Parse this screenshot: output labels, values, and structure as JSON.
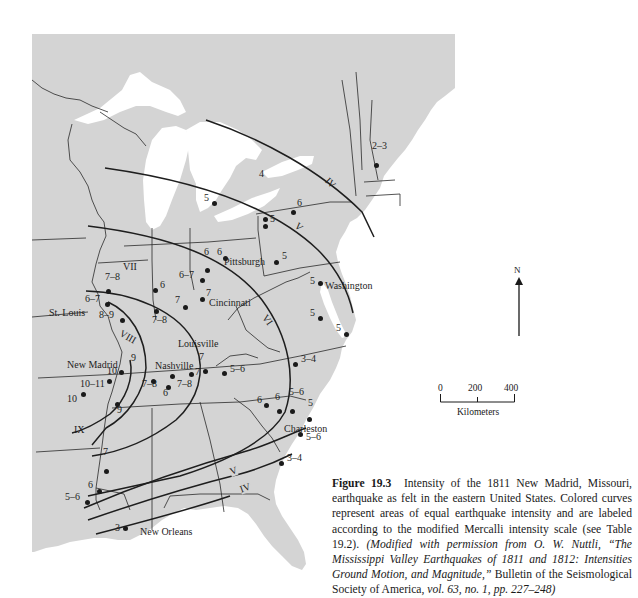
{
  "figure": {
    "number_label": "Figure 19.3",
    "caption_plain": "Intensity of the 1811 New Madrid, Missouri, earthquake as felt in the eastern United States. Colored curves represent areas of equal earthquake intensity and are labeled according to the modified Mercalli intensity scale (see Table 19.2).",
    "caption_italic_1": "(Modified with permission from O. W. Nuttli, “The Mississippi Valley Earthquakes of 1811 and 1812: Intensities Ground Motion, and Magnitude,”",
    "caption_plain_2": "Bulletin of the Seismological Society of America,",
    "caption_italic_2": "vol. 63, no. 1, pp. 227–248)"
  },
  "map": {
    "land_color": "#d4d4d4",
    "water_color": "#ffffff",
    "line_color": "#2a2a2a",
    "cities": [
      {
        "name": "St. Louis",
        "x": 49,
        "y": 308
      },
      {
        "name": "New Madrid",
        "x": 67,
        "y": 360
      },
      {
        "name": "Nashville",
        "x": 155,
        "y": 361
      },
      {
        "name": "Louisville",
        "x": 178,
        "y": 339
      },
      {
        "name": "Cincinnati",
        "x": 209,
        "y": 298
      },
      {
        "name": "Pittsburgh",
        "x": 224,
        "y": 257
      },
      {
        "name": "Washington",
        "x": 325,
        "y": 281
      },
      {
        "name": "Charleston",
        "x": 284,
        "y": 424
      },
      {
        "name": "New Orleans",
        "x": 140,
        "y": 527
      }
    ],
    "isoseismal_labels": [
      {
        "label": "IV",
        "x": 325,
        "y": 178
      },
      {
        "label": "V",
        "x": 295,
        "y": 222
      },
      {
        "label": "VI",
        "x": 262,
        "y": 315
      },
      {
        "label": "VII",
        "x": 123,
        "y": 262
      },
      {
        "label": "VIII",
        "x": 119,
        "y": 332
      },
      {
        "label": "IX",
        "x": 74,
        "y": 425
      },
      {
        "label": "V",
        "x": 230,
        "y": 466
      },
      {
        "label": "IV",
        "x": 240,
        "y": 483
      }
    ],
    "intensity_points": [
      {
        "value": "2–3",
        "x": 376,
        "y": 165,
        "lx": 372,
        "ly": 146
      },
      {
        "value": "4",
        "x": null,
        "y": null,
        "lx": 259,
        "ly": 174
      },
      {
        "value": "6",
        "x": 293,
        "y": 212,
        "lx": 297,
        "ly": 203
      },
      {
        "value": "5",
        "x": 214,
        "y": 203,
        "lx": 204,
        "ly": 198
      },
      {
        "value": "5",
        "x": 265,
        "y": 219,
        "lx": null,
        "ly": null
      },
      {
        "value": "5",
        "x": 265,
        "y": 226,
        "lx": 270,
        "ly": 219
      },
      {
        "value": "5",
        "x": 276,
        "y": 262,
        "lx": 282,
        "ly": 256
      },
      {
        "value": "6",
        "x": 225,
        "y": 258,
        "lx": 217,
        "ly": 252
      },
      {
        "value": "6",
        "x": 207,
        "y": 270,
        "lx": 204,
        "ly": 252
      },
      {
        "value": "6–7",
        "x": 202,
        "y": 280,
        "lx": 179,
        "ly": 275
      },
      {
        "value": "7",
        "x": 202,
        "y": 299,
        "lx": 206,
        "ly": 293
      },
      {
        "value": "7",
        "x": 185,
        "y": 307,
        "lx": 175,
        "ly": 300
      },
      {
        "value": "6",
        "x": 155,
        "y": 290,
        "lx": 160,
        "ly": 285
      },
      {
        "value": "7–8",
        "x": 108,
        "y": 291,
        "lx": 105,
        "ly": 277
      },
      {
        "value": "6–7",
        "x": 107,
        "y": 304,
        "lx": 85,
        "ly": 299
      },
      {
        "value": "8–9",
        "x": 122,
        "y": 320,
        "lx": 99,
        "ly": 315
      },
      {
        "value": "7–8",
        "x": 156,
        "y": 311,
        "lx": 152,
        "ly": 320
      },
      {
        "value": "9",
        "x": null,
        "y": null,
        "lx": 131,
        "ly": 358
      },
      {
        "value": "10",
        "x": 121,
        "y": 372,
        "lx": 107,
        "ly": 371
      },
      {
        "value": "10–11",
        "x": 109,
        "y": 381,
        "lx": 80,
        "ly": 384
      },
      {
        "value": "10",
        "x": 83,
        "y": 394,
        "lx": 67,
        "ly": 399
      },
      {
        "value": "9",
        "x": 117,
        "y": 404,
        "lx": 117,
        "ly": 410
      },
      {
        "value": "7–8",
        "x": 153,
        "y": 381,
        "lx": 142,
        "ly": 384
      },
      {
        "value": "6",
        "x": 168,
        "y": 387,
        "lx": 163,
        "ly": 393
      },
      {
        "value": "7–8",
        "x": 172,
        "y": 376,
        "lx": 177,
        "ly": 384
      },
      {
        "value": "7",
        "x": 191,
        "y": 374,
        "lx": 195,
        "ly": 372
      },
      {
        "value": "7",
        "x": 205,
        "y": 371,
        "lx": 199,
        "ly": 357
      },
      {
        "value": "5–6",
        "x": 224,
        "y": 373,
        "lx": 230,
        "ly": 369
      },
      {
        "value": "3–4",
        "x": 295,
        "y": 364,
        "lx": 301,
        "ly": 359
      },
      {
        "value": "5",
        "x": 320,
        "y": 283,
        "lx": 310,
        "ly": 281
      },
      {
        "value": "5",
        "x": 320,
        "y": 318,
        "lx": 310,
        "ly": 313
      },
      {
        "value": "5",
        "x": 346,
        "y": 334,
        "lx": 336,
        "ly": 328
      },
      {
        "value": "6",
        "x": 266,
        "y": 405,
        "lx": 257,
        "ly": 400
      },
      {
        "value": "6",
        "x": 279,
        "y": 411,
        "lx": 275,
        "ly": 397
      },
      {
        "value": "5–6",
        "x": 292,
        "y": 411,
        "lx": 289,
        "ly": 392
      },
      {
        "value": "5",
        "x": 309,
        "y": 419,
        "lx": 308,
        "ly": 403
      },
      {
        "value": "5–6",
        "x": 300,
        "y": 434,
        "lx": 306,
        "ly": 437
      },
      {
        "value": "3–4",
        "x": 281,
        "y": 463,
        "lx": 287,
        "ly": 458
      },
      {
        "value": "7",
        "x": 106,
        "y": 471,
        "lx": 103,
        "ly": 452
      },
      {
        "value": "6",
        "x": 99,
        "y": 491,
        "lx": 88,
        "ly": 485
      },
      {
        "value": "5–6",
        "x": 87,
        "y": 502,
        "lx": 65,
        "ly": 497
      },
      {
        "value": "3",
        "x": 125,
        "y": 528,
        "lx": 115,
        "ly": 528
      }
    ],
    "north_arrow": {
      "label": "N"
    },
    "scale_bar": {
      "ticks": [
        "0",
        "200",
        "400"
      ],
      "unit": "Kilometers"
    }
  }
}
